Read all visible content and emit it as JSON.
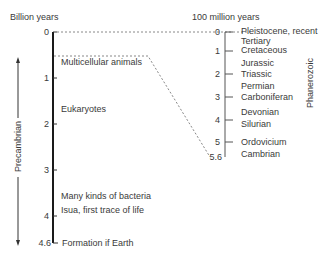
{
  "left_axis": {
    "title": "Billion years",
    "ticks": [
      "0",
      "1",
      "2",
      "3",
      "4",
      "4.6"
    ],
    "era_label": "Precambrian",
    "events": [
      {
        "label": "Multicellular animals",
        "value": 0.55
      },
      {
        "label": "Eukaryotes",
        "value": 2.0
      },
      {
        "label": "Many kinds of bacteria",
        "value": 3.5
      },
      {
        "label": "Isua, first trace of life",
        "value": 3.8
      },
      {
        "label": "Formation if Earth",
        "value": 4.6
      }
    ]
  },
  "right_axis": {
    "title": "100 million years",
    "ticks": [
      "0",
      "1",
      "2",
      "3",
      "4",
      "5",
      "5.6"
    ],
    "era_label": "Phanerozoic",
    "periods": [
      "Pleistocene, recent",
      "Tertiary",
      "Cretaceous",
      "Jurassic",
      "Triassic",
      "Permian",
      "Carboniferan",
      "Devonian",
      "Silurian",
      "Ordovicium",
      "Cambrian"
    ]
  },
  "colors": {
    "axis": "#1a1a1a",
    "text": "#3a3a3a",
    "dashed": "#888888"
  }
}
